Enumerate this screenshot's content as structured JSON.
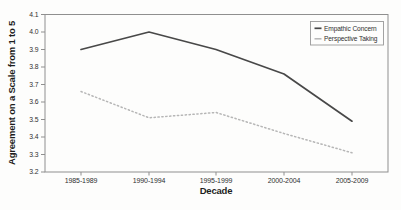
{
  "chart_data": {
    "type": "line",
    "title": "",
    "categories": [
      "1985-1989",
      "1990-1994",
      "1995-1999",
      "2000-2004",
      "2005-2009"
    ],
    "series": [
      {
        "name": "Empathic Concern",
        "values": [
          3.9,
          4.0,
          3.9,
          3.76,
          3.49
        ],
        "line_style": "solid",
        "color": "#484848"
      },
      {
        "name": "Perspective Taking",
        "values": [
          3.66,
          3.51,
          3.54,
          3.42,
          3.31
        ],
        "line_style": "dotted",
        "color": "#b6b6b6"
      }
    ],
    "xlabel": "Decade",
    "ylabel": "Agreement on a Scale from 1 to 5",
    "ylim": [
      3.2,
      4.1
    ],
    "yticks": [
      4.1,
      4.0,
      3.9,
      3.8,
      3.7,
      3.6,
      3.5,
      3.4,
      3.3,
      3.2
    ],
    "ytick_labels": [
      "4.1",
      "4.0",
      "3.9",
      "3.8",
      "3.7",
      "3.6",
      "3.5",
      "3.4",
      "3.3",
      "3.2"
    ],
    "legend": {
      "position": "top-right",
      "entries": [
        "Empathic Concern",
        "Perspective Taking"
      ]
    },
    "grid": false
  },
  "colors": {
    "background": "#fdfdfc",
    "axis": "#8f8f8f",
    "tick_text": "#2f2f2f",
    "title_text": "#1d1d1d",
    "legend_border": "#999999",
    "series_empathic_concern": "#484848",
    "series_perspective_taking": "#b6b6b6"
  }
}
